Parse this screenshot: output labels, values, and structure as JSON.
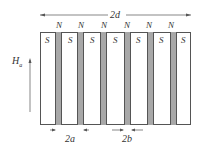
{
  "diagram": {
    "title_dimension": "2d",
    "field_label": "H",
    "field_subscript": "a",
    "north_labels": [
      "N",
      "N",
      "N",
      "N",
      "N",
      "N"
    ],
    "south_labels": [
      "S",
      "S",
      "S",
      "S",
      "S",
      "S",
      "S"
    ],
    "width_a_label": "2a",
    "width_b_label": "2b",
    "colors": {
      "stripe_fill": "#a8a8a8",
      "outline": "#555555",
      "background": "#ffffff"
    }
  }
}
